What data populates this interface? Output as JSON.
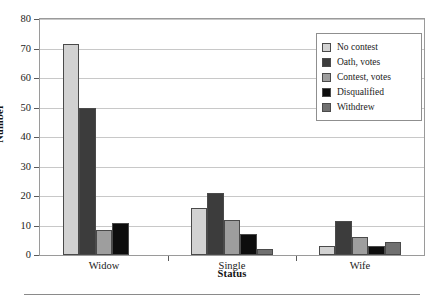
{
  "chart_data": {
    "type": "bar",
    "title": "",
    "xlabel": "Status",
    "ylabel": "Number",
    "categories": [
      "Widow",
      "Single",
      "Wife"
    ],
    "ylim": [
      0,
      80
    ],
    "yticks": [
      0,
      10,
      20,
      30,
      40,
      50,
      60,
      70,
      80
    ],
    "grid": true,
    "legend_position": "top-right",
    "series": [
      {
        "name": "No contest",
        "color": "#d2d2d2",
        "values": [
          71.5,
          16,
          3
        ]
      },
      {
        "name": "Oath, votes",
        "color": "#3c3c3c",
        "values": [
          50,
          21,
          11.5
        ]
      },
      {
        "name": "Contest, votes",
        "color": "#9e9e9e",
        "values": [
          8.5,
          12,
          6
        ]
      },
      {
        "name": "Disqualified",
        "color": "#0d0d0d",
        "values": [
          11,
          7,
          3
        ]
      },
      {
        "name": "Withdrew",
        "color": "#707070",
        "values": [
          0,
          2,
          4.5
        ]
      }
    ]
  },
  "legend": {
    "items": [
      {
        "label": "No contest"
      },
      {
        "label": "Oath, votes"
      },
      {
        "label": "Contest, votes"
      },
      {
        "label": "Disqualified"
      },
      {
        "label": "Withdrew"
      }
    ]
  }
}
